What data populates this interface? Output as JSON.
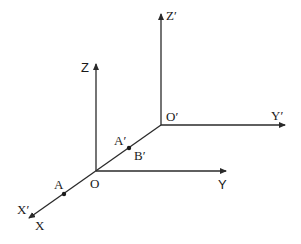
{
  "diagram": {
    "colors": {
      "line": "#2a2a2a",
      "text": "#1a1a1a",
      "background": "#ffffff"
    },
    "origins": {
      "O": {
        "label": "O"
      },
      "O_prime": {
        "label": "O′"
      }
    },
    "axes": {
      "Z": {
        "label": "Z"
      },
      "Y": {
        "label": "Y"
      },
      "X": {
        "label": "X"
      },
      "Z_prime": {
        "label": "Z′"
      },
      "Y_prime": {
        "label": "Y′"
      },
      "X_prime": {
        "label": "X′"
      }
    },
    "points": {
      "A": {
        "label": "A"
      },
      "A_prime": {
        "label": "A′"
      },
      "B_prime": {
        "label": "B′"
      }
    }
  }
}
